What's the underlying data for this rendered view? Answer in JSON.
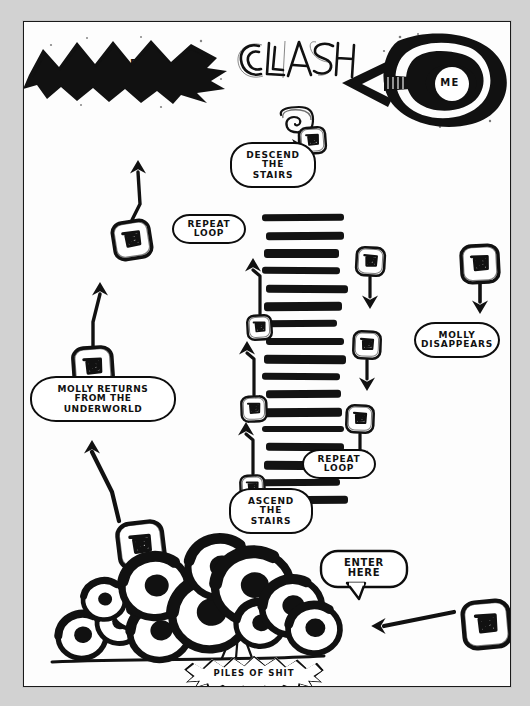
{
  "page": {
    "background": "#d2d2d2",
    "canvas_background": "#fdfdfd",
    "ink_color": "#111111",
    "frame": {
      "x": 23,
      "y": 21,
      "width": 486,
      "height": 664
    }
  },
  "title_block": {
    "text": "CLASH",
    "style": "hand-drawn outline lettering"
  },
  "labels": {
    "anger": "ANGER",
    "me": "ME",
    "descend_the_stairs": "DESCEND\nTHE\nSTAIRS",
    "ascend_the_stairs": "ASCEND\nTHE\nSTAIRS",
    "repeat_loop_upper": "REPEAT\nLOOP",
    "repeat_loop_lower": "REPEAT\nLOOP",
    "molly_disappears": "MOLLY\nDISAPPEARS",
    "molly_returns": "MOLLY RETURNS\nFROM THE\nUNDERWORLD",
    "enter_here": "ENTER\nHERE",
    "piles_of_shit": "PILES OF SHIT"
  },
  "nodes": [
    {
      "id": "spiral-title",
      "name": "spiral-node-below-title",
      "x": 274,
      "y": 104,
      "size": 29,
      "rotation": -4
    },
    {
      "id": "spiral-left-upper",
      "name": "spiral-node-left-upper",
      "x": 88,
      "y": 198,
      "size": 40,
      "rotation": -9
    },
    {
      "id": "spiral-left-lower",
      "name": "spiral-node-left-lower",
      "x": 48,
      "y": 324,
      "size": 42,
      "rotation": -4
    },
    {
      "id": "spiral-right-1",
      "name": "spiral-node-stair-right-1",
      "x": 331,
      "y": 224,
      "size": 31,
      "rotation": 3
    },
    {
      "id": "spiral-left-s1",
      "name": "spiral-node-stair-left-1",
      "x": 222,
      "y": 292,
      "size": 27,
      "rotation": -3
    },
    {
      "id": "spiral-right-2",
      "name": "spiral-node-stair-right-2",
      "x": 328,
      "y": 308,
      "size": 30,
      "rotation": 2
    },
    {
      "id": "spiral-left-s2",
      "name": "spiral-node-stair-left-2",
      "x": 216,
      "y": 373,
      "size": 28,
      "rotation": -2
    },
    {
      "id": "spiral-right-3",
      "name": "spiral-node-stair-right-3",
      "x": 321,
      "y": 382,
      "size": 30,
      "rotation": 2
    },
    {
      "id": "spiral-left-s3",
      "name": "spiral-node-stair-left-3",
      "x": 215,
      "y": 452,
      "size": 27,
      "rotation": -2
    },
    {
      "id": "spiral-far-right",
      "name": "spiral-node-molly-disappears",
      "x": 436,
      "y": 222,
      "size": 40,
      "rotation": -3
    },
    {
      "id": "spiral-underworld",
      "name": "spiral-node-underworld",
      "x": 93,
      "y": 499,
      "size": 48,
      "rotation": -7
    },
    {
      "id": "spiral-enter",
      "name": "spiral-node-enter-here",
      "x": 438,
      "y": 578,
      "size": 49,
      "rotation": -5
    }
  ],
  "stairs": {
    "name": "staircase",
    "step_count": 17,
    "x": 240,
    "y": 192,
    "width": 78,
    "height": 300
  },
  "piles": {
    "name": "piles-of-shit-cluster",
    "blob_count": 12
  },
  "flow": {
    "entry": "ENTER HERE",
    "sequence": [
      "ENTER HERE",
      "DESCEND THE STAIRS",
      "REPEAT LOOP",
      "ASCEND THE STAIRS",
      "REPEAT LOOP",
      "MOLLY RETURNS FROM THE UNDERWORLD",
      "MOLLY DISAPPEARS"
    ]
  }
}
